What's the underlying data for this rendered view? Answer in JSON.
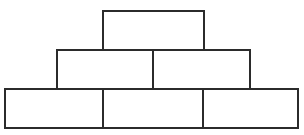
{
  "figure": {
    "name": "brick-pyramid",
    "background_color": "#ffffff",
    "stroke_color": "#2b2b2b",
    "fill_color": "#ffffff",
    "stroke_width": 2,
    "canvas": {
      "width": 304,
      "height": 135
    },
    "rows": [
      {
        "row_name": "top-row",
        "brick_count": 1,
        "y": 11,
        "height": 39,
        "bricks": [
          {
            "name": "brick-top-1",
            "label": "",
            "x": 103,
            "y": 11,
            "width": 101,
            "height": 39
          }
        ]
      },
      {
        "row_name": "middle-row",
        "brick_count": 2,
        "y": 50,
        "height": 39,
        "bricks": [
          {
            "name": "brick-middle-1",
            "label": "",
            "x": 57,
            "y": 50,
            "width": 96,
            "height": 39
          },
          {
            "name": "brick-middle-2",
            "label": "",
            "x": 153,
            "y": 50,
            "width": 97,
            "height": 39
          }
        ]
      },
      {
        "row_name": "bottom-row",
        "brick_count": 3,
        "y": 89,
        "height": 39,
        "bricks": [
          {
            "name": "brick-bottom-1",
            "label": "",
            "x": 5,
            "y": 89,
            "width": 98,
            "height": 39
          },
          {
            "name": "brick-bottom-2",
            "label": "",
            "x": 103,
            "y": 89,
            "width": 100,
            "height": 39
          },
          {
            "name": "brick-bottom-3",
            "label": "",
            "x": 203,
            "y": 89,
            "width": 95,
            "height": 39
          }
        ]
      }
    ]
  }
}
